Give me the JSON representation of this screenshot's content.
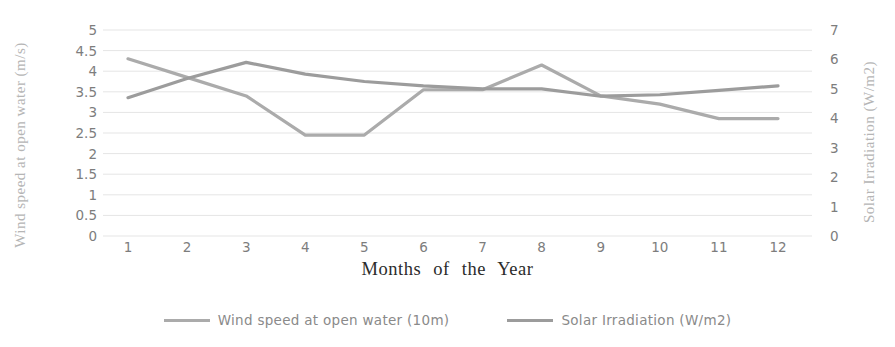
{
  "chart_data": {
    "type": "line",
    "x": [
      1,
      2,
      3,
      4,
      5,
      6,
      7,
      8,
      9,
      10,
      11,
      12
    ],
    "xlabel": "Months of the Year",
    "series": [
      {
        "name": "Wind speed at open water (10m)",
        "axis": "left",
        "color": "#ababab",
        "values": [
          4.3,
          3.85,
          3.4,
          2.45,
          2.45,
          3.55,
          3.55,
          4.15,
          3.4,
          3.2,
          2.85,
          2.85
        ]
      },
      {
        "name": "Solar Irradiation (W/m2)",
        "axis": "right",
        "color": "#9c9c9c",
        "values": [
          4.7,
          5.35,
          5.9,
          5.5,
          5.25,
          5.1,
          5.0,
          5.0,
          4.75,
          4.8,
          4.95,
          5.1
        ]
      }
    ],
    "left_axis": {
      "label": "Wind speed at open water (m/s)",
      "min": 0,
      "max": 5,
      "ticks": [
        0,
        0.5,
        1,
        1.5,
        2,
        2.5,
        3,
        3.5,
        4,
        4.5,
        5
      ]
    },
    "right_axis": {
      "label": "Solar Irradiation (W/m2)",
      "min": 0,
      "max": 7,
      "ticks": [
        0,
        1,
        2,
        3,
        4,
        5,
        6,
        7
      ]
    },
    "grid": true,
    "legend_position": "bottom"
  }
}
